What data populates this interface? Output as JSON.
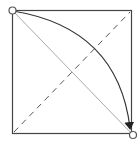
{
  "diagram": {
    "type": "square-with-diagonals-and-arc",
    "colors": {
      "square": "#444444",
      "dashed_diagonal": "#555555",
      "solid_diagonal": "#aaaaaa",
      "arc": "#333333",
      "endpoint": "#555555"
    },
    "square": {
      "x1": 12,
      "y1": 10,
      "x2": 132,
      "y2": 134
    },
    "elements": [
      {
        "name": "dashed-diagonal",
        "from": "bottom-left",
        "to": "top-right",
        "style": "dashed"
      },
      {
        "name": "solid-diagonal",
        "from": "top-left",
        "to": "bottom-right",
        "style": "solid-light"
      },
      {
        "name": "curved-arrow",
        "from": "top-left",
        "to": "bottom-right",
        "style": "arc-with-arrowhead"
      },
      {
        "name": "start-point",
        "at": "top-left",
        "style": "open-circle"
      },
      {
        "name": "end-point",
        "at": "bottom-right",
        "style": "open-circle"
      }
    ]
  }
}
